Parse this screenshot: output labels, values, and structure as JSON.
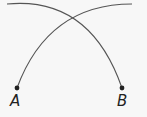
{
  "diagram": {
    "type": "intersecting-arcs",
    "points": [
      {
        "label": "A",
        "x": 17,
        "y": 88
      },
      {
        "label": "B",
        "x": 122,
        "y": 88
      }
    ],
    "arcs": [
      {
        "name": "arc-from-a",
        "from": "A",
        "to": "top-right"
      },
      {
        "name": "arc-to-b",
        "from": "top-left",
        "to": "B"
      }
    ],
    "colors": {
      "background": "#f7f7f7",
      "stroke": "#555555",
      "point": "#222222",
      "label": "#222222"
    }
  }
}
